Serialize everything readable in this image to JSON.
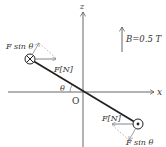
{
  "diagram": {
    "axes": {
      "x_label": "x",
      "z_label": "z",
      "origin_label": "O"
    },
    "field": {
      "label": "B=0.5 T",
      "direction": "+z"
    },
    "rod": {
      "angle_label": "θ",
      "upper_end_symbol": "current-into-page",
      "lower_end_symbol": "current-out-of-page"
    },
    "forces": {
      "upper": {
        "magnetic_force_label": "F[N]",
        "component_label": "F sin θ"
      },
      "lower": {
        "magnetic_force_label": "F[N]",
        "component_label": "F sin θ"
      }
    },
    "colors": {
      "axis": "#555555",
      "rod": "#222222",
      "force_arrow": "#666666",
      "component_arrow": "#999999"
    }
  }
}
